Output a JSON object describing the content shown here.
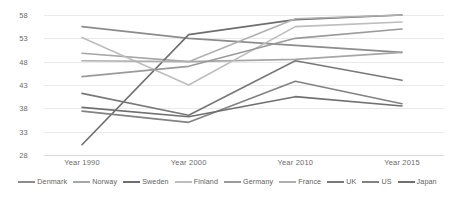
{
  "chart_data": {
    "type": "line",
    "title": "",
    "xlabel": "",
    "ylabel": "",
    "categories": [
      "Year 1990",
      "Year 2000",
      "Year 2010",
      "Year 2015"
    ],
    "ylim": [
      28,
      58
    ],
    "yticks": [
      28,
      33,
      38,
      43,
      48,
      53,
      58
    ],
    "grid": true,
    "legend_position": "bottom",
    "series": [
      {
        "name": "Denmark",
        "values": [
          55.5,
          53.0,
          51.5,
          50.0
        ],
        "color": "#8c8c8c"
      },
      {
        "name": "Norway",
        "values": [
          49.8,
          48.0,
          48.5,
          50.0
        ],
        "color": "#a6a6a6"
      },
      {
        "name": "Sweden",
        "values": [
          30.2,
          53.8,
          57.0,
          58.0
        ],
        "color": "#6e6e6e"
      },
      {
        "name": "Finland",
        "values": [
          53.2,
          43.0,
          55.5,
          56.5
        ],
        "color": "#bdbdbd"
      },
      {
        "name": "Germany",
        "values": [
          44.8,
          47.0,
          53.0,
          55.0
        ],
        "color": "#9a9a9a"
      },
      {
        "name": "France",
        "values": [
          48.2,
          48.0,
          57.2,
          58.0
        ],
        "color": "#b0b0b0"
      },
      {
        "name": "UK",
        "values": [
          41.2,
          36.5,
          48.2,
          44.0
        ],
        "color": "#787878"
      },
      {
        "name": "US",
        "values": [
          37.4,
          35.0,
          43.8,
          39.0
        ],
        "color": "#828282"
      },
      {
        "name": "Japan",
        "values": [
          38.2,
          36.2,
          40.5,
          38.5
        ],
        "color": "#707070"
      }
    ]
  },
  "axis": {
    "y_labels": [
      "58",
      "53",
      "48",
      "43",
      "38",
      "33",
      "28"
    ],
    "x_labels": [
      "Year 1990",
      "Year 2000",
      "Year 2010",
      "Year 2015"
    ]
  },
  "legend": {
    "items": [
      {
        "label": "Denmark"
      },
      {
        "label": "Norway"
      },
      {
        "label": "Sweden"
      },
      {
        "label": "Finland"
      },
      {
        "label": "Germany"
      },
      {
        "label": "France"
      },
      {
        "label": "UK"
      },
      {
        "label": "US"
      },
      {
        "label": "Japan"
      }
    ]
  }
}
